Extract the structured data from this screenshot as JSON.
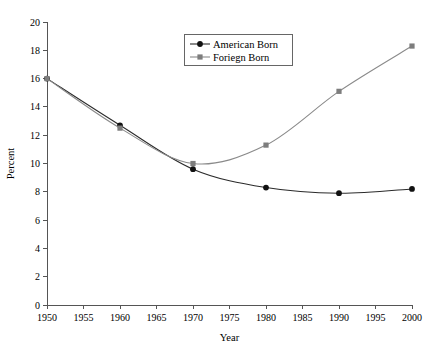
{
  "chart_data": {
    "type": "line",
    "title": "",
    "xlabel": "Year",
    "ylabel": "Percent",
    "x": [
      1950,
      1960,
      1970,
      1980,
      1990,
      2000
    ],
    "xlim": [
      1950,
      2000
    ],
    "ylim": [
      0,
      20
    ],
    "xticks": [
      1950,
      1955,
      1960,
      1965,
      1970,
      1975,
      1980,
      1985,
      1990,
      1995,
      2000
    ],
    "yticks": [
      0,
      2,
      4,
      6,
      8,
      10,
      12,
      14,
      16,
      18,
      20
    ],
    "xtick_labels": [
      "1950",
      "1955",
      "1960",
      "1965",
      "1970",
      "1975",
      "1980",
      "1985",
      "1990",
      "1995",
      "2000"
    ],
    "ytick_labels": [
      "0",
      "2",
      "4",
      "6",
      "8",
      "10",
      "12",
      "14",
      "16",
      "18",
      "20"
    ],
    "grid": false,
    "legend_position": "upper-center",
    "series": [
      {
        "name": "American Born",
        "color": "#2b2b2b",
        "marker": "circle",
        "values": [
          16.0,
          12.7,
          9.6,
          8.3,
          7.9,
          8.2
        ]
      },
      {
        "name": "Foriegn Born",
        "color": "#8a8a8a",
        "marker": "square",
        "values": [
          16.0,
          12.5,
          10.0,
          11.3,
          15.1,
          18.3
        ]
      }
    ]
  },
  "legend": {
    "entries": [
      {
        "label": "American Born"
      },
      {
        "label": "Foriegn Born"
      }
    ]
  },
  "axes": {
    "x_title": "Year",
    "y_title": "Percent"
  }
}
